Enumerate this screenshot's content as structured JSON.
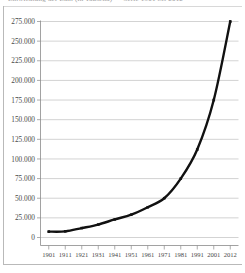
{
  "title_sliver": {
    "text": "Entwicklung der Zahl (in Tausend) — Serie 1901 bis 2012",
    "legible": false
  },
  "chart_data": {
    "type": "line",
    "title": "",
    "xlabel": "",
    "ylabel": "",
    "categories": [
      "1901",
      "1911",
      "1921",
      "1931",
      "1941",
      "1951",
      "1961",
      "1971",
      "1981",
      "1991",
      "2001",
      "2012"
    ],
    "x": [
      1901,
      1911,
      1921,
      1931,
      1941,
      1951,
      1961,
      1971,
      1981,
      1991,
      2001,
      2012
    ],
    "values": [
      7500,
      7800,
      12000,
      16500,
      23000,
      29000,
      38500,
      50000,
      75000,
      112000,
      175000,
      275000
    ],
    "series": [
      {
        "name": "series-1",
        "values": [
          7500,
          7800,
          12000,
          16500,
          23000,
          29000,
          38500,
          50000,
          75000,
          112000,
          175000,
          275000
        ],
        "color": "#111111",
        "marker": "square"
      }
    ],
    "ylim": [
      0,
      275000
    ],
    "xlim": [
      1901,
      2012
    ],
    "yticks": [
      0,
      25000,
      50000,
      75000,
      100000,
      125000,
      150000,
      175000,
      200000,
      225000,
      250000,
      275000
    ],
    "ytick_labels": [
      "0",
      "25.000",
      "50.000",
      "75.000",
      "100.000",
      "125.000",
      "150.000",
      "175.000",
      "200.000",
      "225.000",
      "250.000",
      "275.000"
    ],
    "xtick_labels": [
      "1901",
      "1911",
      "1921",
      "1931",
      "1941",
      "1951",
      "1961",
      "1971",
      "1981",
      "1991",
      "2001",
      "2012"
    ],
    "grid": true,
    "grid_axis": "y",
    "legend": false,
    "legend_position": "none",
    "background_color": "#ffffff",
    "gridline_color": "#c0c0c0",
    "axis_color": "#8a8a8a",
    "series_color": "#111111"
  }
}
